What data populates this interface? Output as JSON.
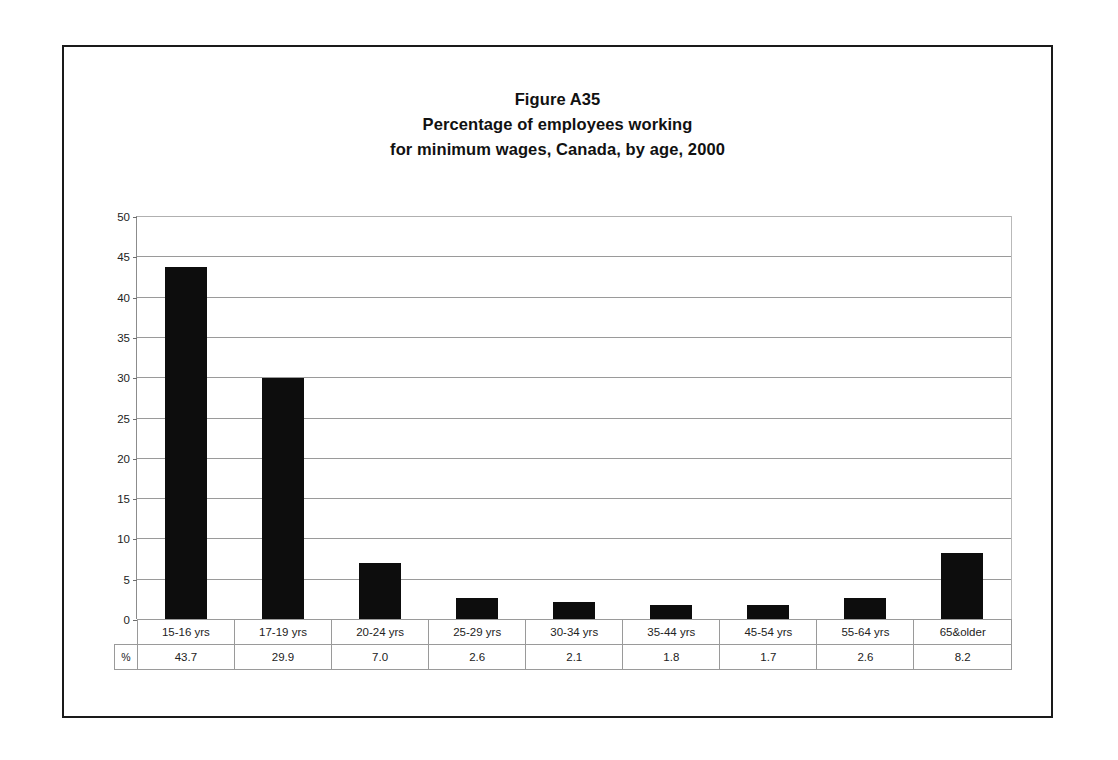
{
  "figure": {
    "title_lines": [
      "Figure A35",
      "Percentage of employees working",
      "for minimum wages, Canada, by age, 2000"
    ],
    "unit_label": "%",
    "border_color": "#1a1a1a",
    "bar_color": "#0d0d0d",
    "grid_color": "#9a9a9a",
    "background_color": "#ffffff"
  },
  "chart_data": {
    "type": "bar",
    "title": "Figure A35 Percentage of employees working for minimum wages, Canada, by age, 2000",
    "categories": [
      "15-16 yrs",
      "17-19 yrs",
      "20-24 yrs",
      "25-29 yrs",
      "30-34 yrs",
      "35-44 yrs",
      "45-54 yrs",
      "55-64 yrs",
      "65&older"
    ],
    "values": [
      43.7,
      29.9,
      7.0,
      2.6,
      2.1,
      1.8,
      1.7,
      2.6,
      8.2
    ],
    "value_labels": [
      "43.7",
      "29.9",
      "7.0",
      "2.6",
      "2.1",
      "1.8",
      "1.7",
      "2.6",
      "8.2"
    ],
    "xlabel": "",
    "ylabel": "",
    "ylim": [
      0,
      50
    ],
    "ytick_labels": [
      "0",
      "5",
      "10",
      "15",
      "20",
      "25",
      "30",
      "35",
      "40",
      "45",
      "50"
    ],
    "ytick_values": [
      0,
      5,
      10,
      15,
      20,
      25,
      30,
      35,
      40,
      45,
      50
    ],
    "grid": "horizontal",
    "legend": "none",
    "series_name": "%"
  }
}
